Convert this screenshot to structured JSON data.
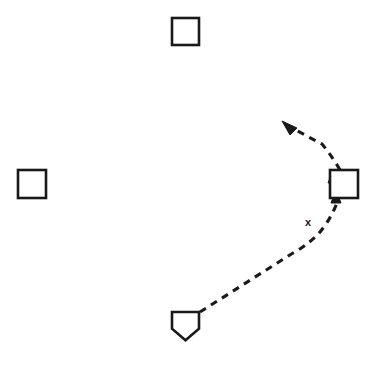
{
  "diagram": {
    "background_color": "#ffffff",
    "ink_color": "#1a1a1a",
    "width": 384,
    "height": 372,
    "bases": [
      {
        "name": "second-base",
        "label": "",
        "shape": "square",
        "x": 172,
        "y": 18,
        "size": 27
      },
      {
        "name": "third-base",
        "label": "",
        "shape": "square",
        "x": 18,
        "y": 170,
        "size": 28
      },
      {
        "name": "first-base",
        "label": "",
        "shape": "square",
        "x": 330,
        "y": 170,
        "size": 28
      },
      {
        "name": "home-plate",
        "label": "",
        "shape": "pentagon",
        "x": 172,
        "y": 312,
        "size": 27
      }
    ],
    "markers": [
      {
        "name": "x-marker",
        "label": "x",
        "x": 308,
        "y": 226
      }
    ],
    "paths": [
      {
        "name": "home-to-first-run-path",
        "style": "dashed",
        "dash_pattern": "7 6",
        "d": "M 200 312 L 293 253 Q 302 248 308 243 Q 318 236 326 224 Q 334 212 338 200"
      },
      {
        "name": "first-base-overrun-path",
        "style": "dashed",
        "dash_pattern": "7 6",
        "d": "M 340 170 Q 332 156 322 144 L 288 126"
      }
    ],
    "arrowheads": [
      {
        "name": "arrow-into-first-base",
        "points": "336,190 331,203 341,203",
        "direction": "up"
      },
      {
        "name": "arrow-at-first-base-corner",
        "points": "333,170 328,183 339,182",
        "direction": "up"
      },
      {
        "name": "arrow-overrun-tip",
        "points": "282,121 297,128 290,135",
        "direction": "up-left"
      }
    ]
  }
}
